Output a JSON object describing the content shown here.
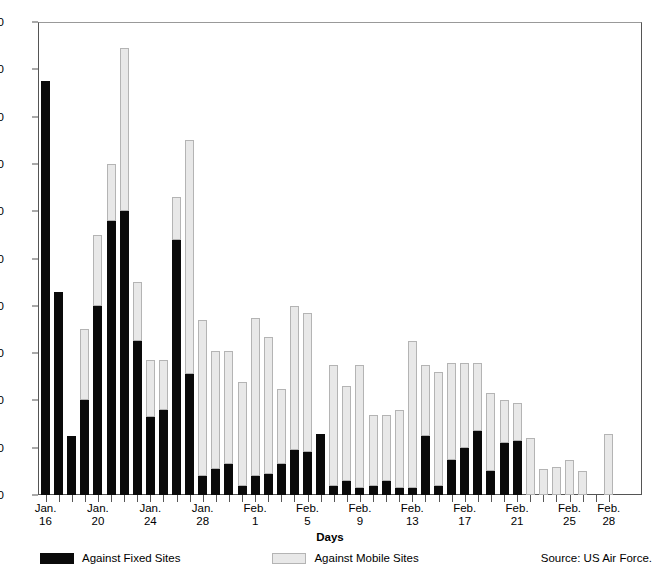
{
  "chart_data": {
    "type": "bar",
    "subtype": "stacked-vertical",
    "title": "",
    "xlabel": "Days",
    "ylabel": "",
    "ylim": [
      0,
      200
    ],
    "yticks": [
      0,
      20,
      40,
      60,
      80,
      100,
      120,
      140,
      160,
      180,
      200
    ],
    "grid": false,
    "legend_position": "bottom-left",
    "series": [
      {
        "name": "Against Fixed Sites",
        "color": "#0a0a0a",
        "values": [
          175,
          86,
          25,
          40,
          80,
          116,
          120,
          65,
          33,
          36,
          108,
          51,
          8,
          11,
          13,
          4,
          8,
          9,
          13,
          19,
          18,
          26,
          4,
          6,
          3,
          4,
          6,
          3,
          3,
          25,
          4,
          15,
          20,
          27,
          10,
          22,
          23,
          0,
          0,
          0,
          0,
          0,
          0,
          0
        ]
      },
      {
        "name": "Against Mobile Sites",
        "color": "#e8e8e8",
        "values": [
          0,
          0,
          0,
          30,
          30,
          24,
          69,
          25,
          24,
          21,
          18,
          99,
          66,
          50,
          48,
          44,
          67,
          58,
          32,
          61,
          59,
          0,
          51,
          40,
          52,
          30,
          28,
          33,
          62,
          30,
          48,
          41,
          36,
          29,
          33,
          18,
          16,
          24,
          11,
          12,
          15,
          10,
          0,
          26
        ]
      }
    ],
    "totals": [
      175,
      86,
      25,
      70,
      110,
      140,
      189,
      90,
      57,
      57,
      126,
      150,
      74,
      61,
      61,
      48,
      75,
      67,
      45,
      80,
      77,
      26,
      55,
      46,
      55,
      34,
      34,
      36,
      65,
      55,
      52,
      56,
      56,
      56,
      43,
      40,
      39,
      24,
      11,
      12,
      15,
      13,
      0,
      26
    ],
    "categories": [
      "Jan. 16",
      "Jan. 17",
      "Jan. 18",
      "Jan. 19",
      "Jan. 20",
      "Jan. 21",
      "Jan. 22",
      "Jan. 23",
      "Jan. 24",
      "Jan. 25",
      "Jan. 26",
      "Jan. 27",
      "Jan. 28",
      "Jan. 29",
      "Jan. 30",
      "Jan. 31",
      "Feb. 1",
      "Feb. 2",
      "Feb. 3",
      "Feb. 4",
      "Feb. 5",
      "Feb. 6",
      "Feb. 7",
      "Feb. 8",
      "Feb. 9",
      "Feb. 10",
      "Feb. 11",
      "Feb. 12",
      "Feb. 13",
      "Feb. 14",
      "Feb. 15",
      "Feb. 16",
      "Feb. 17",
      "Feb. 18",
      "Feb. 19",
      "Feb. 20",
      "Feb. 21",
      "Feb. 22",
      "Feb. 23",
      "Feb. 24",
      "Feb. 25",
      "Feb. 26",
      "Feb. 27",
      "Feb. 28"
    ],
    "xticklabels": [
      {
        "index": 0,
        "month": "Jan.",
        "day": "16"
      },
      {
        "index": 4,
        "month": "Jan.",
        "day": "20"
      },
      {
        "index": 8,
        "month": "Jan.",
        "day": "24"
      },
      {
        "index": 12,
        "month": "Jan.",
        "day": "28"
      },
      {
        "index": 16,
        "month": "Feb.",
        "day": "1"
      },
      {
        "index": 20,
        "month": "Feb.",
        "day": "5"
      },
      {
        "index": 24,
        "month": "Feb.",
        "day": "9"
      },
      {
        "index": 28,
        "month": "Feb.",
        "day": "13"
      },
      {
        "index": 32,
        "month": "Feb.",
        "day": "17"
      },
      {
        "index": 36,
        "month": "Feb.",
        "day": "21"
      },
      {
        "index": 40,
        "month": "Feb.",
        "day": "25"
      },
      {
        "index": 43,
        "month": "Feb.",
        "day": "28"
      }
    ]
  },
  "axis_title": "Days",
  "legend": {
    "fixed_label": "Against Fixed Sites",
    "mobile_label": "Against Mobile Sites"
  },
  "source": "Source: US Air Force."
}
